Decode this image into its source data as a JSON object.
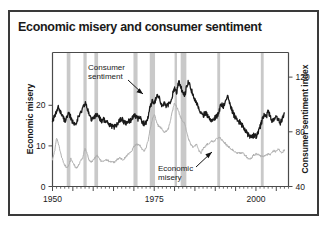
{
  "figure": {
    "title": "Economic misery and consumer sentiment",
    "border_color": "#3a3a3a",
    "background": "#ffffff"
  },
  "chart_data": {
    "type": "line",
    "title": "Economic misery and consumer sentiment",
    "xlabel": "",
    "ylabel": "Economic misery",
    "y2label": "Consumer sentiment index",
    "xlim": [
      1950,
      2008
    ],
    "ylim": [
      0,
      33
    ],
    "y2lim": [
      138,
      40
    ],
    "y2_inverted": true,
    "grid": false,
    "legend": "annotations",
    "xticks": [
      1950,
      1975,
      2000
    ],
    "xticklabels": [
      "1950",
      "1975",
      "2000"
    ],
    "xminor_tick_interval": 1,
    "xmajor_tick_interval": 5,
    "yticks": [
      0,
      10,
      20
    ],
    "yticklabels": [
      "0",
      "10",
      "20"
    ],
    "y2ticks": [
      40,
      80,
      120
    ],
    "y2ticklabels": [
      "40",
      "80",
      "120"
    ],
    "annotations": [
      {
        "text_line1": "Consumer",
        "text_line2": "sentiment",
        "target_series": "consumer_sentiment",
        "arrow": true
      },
      {
        "text_line1": "Economic",
        "text_line2": "misery",
        "target_series": "economic_misery",
        "arrow": true
      }
    ],
    "recession_bands": {
      "color": "#c9c9c9",
      "label": "recessions",
      "spans": [
        [
          1953.5,
          1954.4
        ],
        [
          1957.6,
          1958.4
        ],
        [
          1960.3,
          1961.2
        ],
        [
          1969.9,
          1970.9
        ],
        [
          1973.9,
          1975.2
        ],
        [
          1980.0,
          1980.6
        ],
        [
          1981.5,
          1982.9
        ],
        [
          1990.5,
          1991.2
        ],
        [
          2001.2,
          2001.9
        ]
      ]
    },
    "series": [
      {
        "name": "Consumer sentiment",
        "axis": "right",
        "color": "#1a1a1a",
        "linewidth": 1.3,
        "note": "plotted on inverted right-hand scale (40 top, 120 bottom); drawn in chart units of the left axis for rendering",
        "x": [
          1950.0,
          1950.5,
          1951.0,
          1951.5,
          1952.0,
          1952.5,
          1953.0,
          1953.5,
          1954.0,
          1954.5,
          1955.0,
          1955.5,
          1956.0,
          1956.5,
          1957.0,
          1957.5,
          1958.0,
          1958.5,
          1959.0,
          1959.5,
          1960.0,
          1960.5,
          1961.0,
          1961.5,
          1962.0,
          1962.5,
          1963.0,
          1963.5,
          1964.0,
          1964.5,
          1965.0,
          1965.5,
          1966.0,
          1966.5,
          1967.0,
          1967.5,
          1968.0,
          1968.5,
          1969.0,
          1969.5,
          1970.0,
          1970.5,
          1971.0,
          1971.5,
          1972.0,
          1972.5,
          1973.0,
          1973.5,
          1974.0,
          1974.5,
          1975.0,
          1975.5,
          1976.0,
          1976.5,
          1977.0,
          1977.5,
          1978.0,
          1978.5,
          1979.0,
          1979.5,
          1980.0,
          1980.5,
          1981.0,
          1981.5,
          1982.0,
          1982.5,
          1983.0,
          1983.5,
          1984.0,
          1984.5,
          1985.0,
          1985.5,
          1986.0,
          1986.5,
          1987.0,
          1987.5,
          1988.0,
          1988.5,
          1989.0,
          1989.5,
          1990.0,
          1990.5,
          1991.0,
          1991.5,
          1992.0,
          1992.5,
          1993.0,
          1993.5,
          1994.0,
          1994.5,
          1995.0,
          1995.5,
          1996.0,
          1996.5,
          1997.0,
          1997.5,
          1998.0,
          1998.5,
          1999.0,
          1999.5,
          2000.0,
          2000.5,
          2001.0,
          2001.5,
          2002.0,
          2002.5,
          2003.0,
          2003.5,
          2004.0,
          2004.5,
          2005.0,
          2005.5,
          2006.0,
          2006.5,
          2007.0
        ],
        "values_left_axis_units": [
          16.5,
          17.0,
          18.4,
          19.6,
          18.3,
          17.2,
          16.3,
          16.9,
          17.8,
          17.0,
          15.8,
          15.3,
          16.3,
          17.4,
          18.2,
          19.5,
          20.6,
          19.3,
          17.8,
          16.6,
          16.6,
          17.4,
          17.9,
          17.0,
          16.2,
          16.6,
          16.1,
          15.6,
          15.2,
          14.8,
          14.6,
          14.9,
          15.3,
          16.4,
          16.8,
          16.0,
          15.6,
          16.2,
          16.0,
          16.7,
          17.6,
          17.4,
          16.5,
          17.0,
          16.0,
          15.4,
          15.9,
          17.3,
          19.6,
          21.0,
          20.3,
          21.8,
          22.3,
          21.0,
          19.7,
          20.5,
          19.6,
          20.2,
          21.0,
          22.6,
          24.2,
          23.0,
          25.8,
          24.6,
          23.0,
          22.4,
          24.8,
          26.0,
          24.2,
          22.6,
          21.4,
          20.2,
          19.4,
          18.0,
          17.4,
          18.2,
          17.6,
          16.8,
          16.4,
          16.6,
          17.0,
          17.3,
          18.8,
          20.3,
          19.6,
          21.2,
          22.7,
          21.0,
          19.0,
          17.8,
          16.9,
          16.2,
          15.9,
          15.3,
          14.4,
          13.6,
          12.8,
          12.4,
          12.2,
          12.6,
          12.4,
          13.1,
          14.6,
          16.3,
          17.7,
          17.0,
          18.5,
          17.2,
          16.2,
          16.8,
          17.4,
          16.3,
          15.6,
          16.9,
          18.1
        ]
      },
      {
        "name": "Economic misery",
        "axis": "left",
        "color": "#b0b0b0",
        "linewidth": 1.0,
        "x": [
          1950.0,
          1950.5,
          1951.0,
          1951.5,
          1952.0,
          1952.5,
          1953.0,
          1953.5,
          1954.0,
          1954.5,
          1955.0,
          1955.5,
          1956.0,
          1956.5,
          1957.0,
          1957.5,
          1958.0,
          1958.5,
          1959.0,
          1959.5,
          1960.0,
          1960.5,
          1961.0,
          1961.5,
          1962.0,
          1962.5,
          1963.0,
          1963.5,
          1964.0,
          1964.5,
          1965.0,
          1965.5,
          1966.0,
          1966.5,
          1967.0,
          1967.5,
          1968.0,
          1968.5,
          1969.0,
          1969.5,
          1970.0,
          1970.5,
          1971.0,
          1971.5,
          1972.0,
          1972.5,
          1973.0,
          1973.5,
          1974.0,
          1974.5,
          1975.0,
          1975.5,
          1976.0,
          1976.5,
          1977.0,
          1977.5,
          1978.0,
          1978.5,
          1979.0,
          1979.5,
          1980.0,
          1980.5,
          1981.0,
          1981.5,
          1982.0,
          1982.5,
          1983.0,
          1983.5,
          1984.0,
          1984.5,
          1985.0,
          1985.5,
          1986.0,
          1986.5,
          1987.0,
          1987.5,
          1988.0,
          1988.5,
          1989.0,
          1989.5,
          1990.0,
          1990.5,
          1991.0,
          1991.5,
          1992.0,
          1992.5,
          1993.0,
          1993.5,
          1994.0,
          1994.5,
          1995.0,
          1995.5,
          1996.0,
          1996.5,
          1997.0,
          1997.5,
          1998.0,
          1998.5,
          1999.0,
          1999.5,
          2000.0,
          2000.5,
          2001.0,
          2001.5,
          2002.0,
          2002.5,
          2003.0,
          2003.5,
          2004.0,
          2004.5,
          2005.0,
          2005.5,
          2006.0,
          2006.5,
          2007.0
        ],
        "values": [
          6.8,
          8.4,
          11.9,
          10.4,
          8.2,
          6.4,
          5.3,
          4.6,
          5.2,
          6.8,
          5.9,
          5.0,
          4.6,
          5.4,
          6.6,
          7.2,
          9.4,
          8.0,
          6.6,
          6.0,
          6.4,
          7.1,
          7.6,
          6.8,
          6.2,
          6.4,
          6.6,
          6.5,
          6.2,
          6.1,
          6.0,
          6.2,
          6.8,
          7.0,
          6.8,
          6.6,
          7.4,
          7.9,
          8.4,
          8.9,
          9.8,
          10.2,
          10.4,
          10.0,
          9.2,
          8.8,
          9.6,
          11.4,
          14.2,
          16.4,
          17.8,
          16.2,
          15.0,
          14.6,
          14.0,
          13.4,
          13.6,
          14.2,
          16.4,
          18.6,
          20.6,
          19.8,
          18.4,
          17.0,
          16.2,
          15.6,
          13.2,
          11.4,
          10.4,
          9.8,
          10.0,
          10.4,
          8.8,
          8.2,
          9.4,
          9.8,
          10.4,
          10.6,
          11.2,
          11.0,
          11.4,
          11.8,
          12.2,
          11.6,
          11.0,
          10.6,
          10.0,
          9.6,
          9.2,
          8.8,
          8.4,
          8.3,
          8.2,
          8.4,
          8.0,
          7.6,
          6.9,
          6.8,
          7.2,
          7.8,
          8.0,
          7.8,
          7.6,
          7.5,
          7.4,
          7.6,
          8.0,
          7.7,
          8.4,
          8.8,
          8.6,
          9.4,
          8.6,
          8.4,
          9.0
        ]
      }
    ]
  },
  "axes": {
    "left_title": "Economic misery",
    "right_title": "Consumer sentiment index"
  }
}
